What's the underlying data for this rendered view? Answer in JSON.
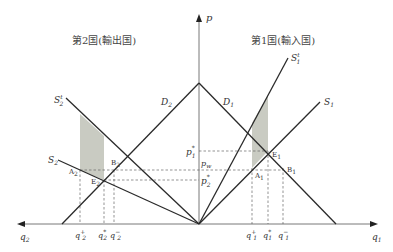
{
  "diagram": {
    "country2_title": "第2国(輸出国)",
    "country1_title": "第1国(輸入国)",
    "axes": {
      "vertical": "p",
      "right": "q",
      "right_sub": "1",
      "left": "q",
      "left_sub": "2"
    },
    "curves": {
      "D2": {
        "main": "D",
        "sub": "2"
      },
      "D1": {
        "main": "D",
        "sub": "1"
      },
      "S1": {
        "main": "S",
        "sub": "1"
      },
      "S1p": {
        "main": "S",
        "sub": "1",
        "sup": "t"
      },
      "S2": {
        "main": "S",
        "sub": "2"
      },
      "S2p": {
        "main": "S",
        "sub": "2",
        "sup": "t"
      }
    },
    "points": {
      "E1": {
        "main": "E",
        "sub": "1"
      },
      "A1": {
        "main": "A",
        "sub": "1"
      },
      "B1": {
        "main": "B",
        "sub": "1"
      },
      "E2": {
        "main": "E",
        "sub": "2"
      },
      "A2": {
        "main": "A",
        "sub": "2"
      },
      "B2": {
        "main": "B",
        "sub": "2"
      }
    },
    "price_labels": {
      "p1star": {
        "main": "p",
        "sub": "1",
        "sup": "*"
      },
      "pw": {
        "main": "p",
        "sub": "w"
      },
      "p2star": {
        "main": "p",
        "sub": "2",
        "sup": "*"
      }
    },
    "quantity_labels_country1": [
      {
        "main": "q",
        "sub": "1",
        "sup": "+"
      },
      {
        "main": "q",
        "sub": "1",
        "sup": "*"
      },
      {
        "main": "q",
        "sub": "1",
        "sup": "−"
      }
    ],
    "quantity_labels_country2": [
      {
        "main": "q",
        "sub": "2",
        "sup": "+"
      },
      {
        "main": "q",
        "sub": "2",
        "sup": "*"
      },
      {
        "main": "q",
        "sub": "2",
        "sup": "−"
      }
    ],
    "colors": {
      "line": "#2a2a2a",
      "axis": "#555555",
      "shade": "#c9cbc2",
      "dash": "#666666"
    }
  }
}
